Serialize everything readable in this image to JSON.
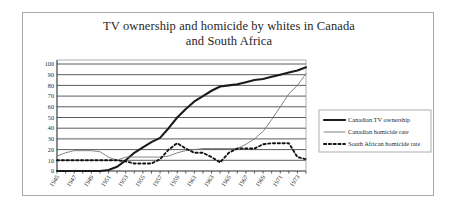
{
  "chart_data": {
    "type": "line",
    "title": "TV ownership and homicide by whites in Canada and South Africa",
    "title_lines": [
      "TV ownership and homicide by whites in Canada",
      "and South Africa"
    ],
    "xlabel": "",
    "ylabel": "",
    "ylim": [
      0,
      100
    ],
    "xlim": [
      1945,
      1974
    ],
    "ytick_step": 10,
    "yticks": [
      0,
      10,
      20,
      30,
      40,
      50,
      60,
      70,
      80,
      90,
      100
    ],
    "grid": "horizontal",
    "legend_position": "right",
    "x": [
      1945,
      1946,
      1947,
      1948,
      1949,
      1950,
      1951,
      1952,
      1953,
      1954,
      1955,
      1956,
      1957,
      1958,
      1959,
      1960,
      1961,
      1962,
      1963,
      1964,
      1965,
      1966,
      1967,
      1968,
      1969,
      1970,
      1971,
      1972,
      1973,
      1974
    ],
    "xtick_labels": [
      "1945",
      "1947",
      "1949",
      "1951",
      "1953",
      "1955",
      "1957",
      "1959",
      "1961",
      "1963",
      "1965",
      "1967",
      "1969",
      "1971",
      "1973"
    ],
    "series": [
      {
        "name": "Canadian TV ownership",
        "style": "solid-thick",
        "color": "#1a1a1a",
        "values": [
          0,
          0,
          0,
          0,
          0,
          0,
          1,
          4,
          10,
          17,
          22,
          27,
          31,
          40,
          50,
          58,
          65,
          70,
          75,
          79,
          80,
          81,
          83,
          85,
          86,
          88,
          90,
          92,
          94,
          97
        ]
      },
      {
        "name": "Canadian homicide rate",
        "style": "solid-thin",
        "color": "#6e6e6e",
        "values": [
          14,
          17,
          19,
          19,
          19,
          18,
          13,
          10,
          13,
          13,
          13,
          13,
          13,
          14,
          17,
          19,
          20,
          21,
          21,
          21,
          21,
          21,
          25,
          30,
          37,
          48,
          60,
          72,
          80,
          91
        ]
      },
      {
        "name": "South African homicide rate",
        "style": "dashed",
        "color": "#121212",
        "values": [
          10,
          10,
          10,
          10,
          10,
          10,
          10,
          10,
          9,
          7,
          7,
          7,
          11,
          20,
          26,
          21,
          17,
          17,
          13,
          8,
          17,
          21,
          21,
          21,
          25,
          26,
          26,
          26,
          13,
          11
        ]
      }
    ]
  },
  "legend": {
    "items": [
      {
        "label": "Canadian TV ownership"
      },
      {
        "label": "Canadian homicide rate"
      },
      {
        "label": "South African homicide rate"
      }
    ]
  }
}
